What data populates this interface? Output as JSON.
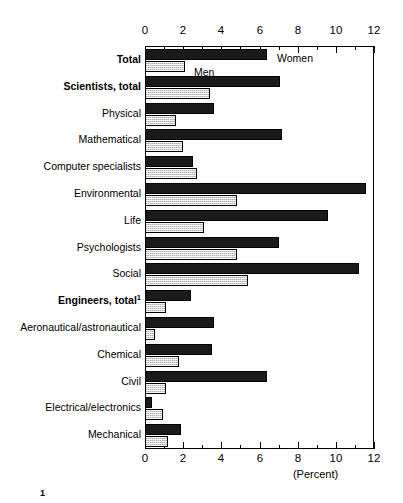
{
  "chart_data": {
    "type": "bar",
    "orientation": "horizontal",
    "title": "",
    "xlabel": "(Percent)",
    "ylabel": "",
    "xlim": [
      0,
      12
    ],
    "xticks": [
      0,
      2,
      4,
      6,
      8,
      10,
      12
    ],
    "xtick_labels": [
      "0",
      "2",
      "4",
      "6",
      "8",
      "10",
      "12"
    ],
    "minor_tick_step": 1,
    "grid": false,
    "legend_position": "in-plot annotations near top bars",
    "axis_top_labels": true,
    "axis_bottom_labels": true,
    "categories": [
      "Total",
      "Scientists, total",
      "Physical",
      "Mathematical",
      "Computer specialists",
      "Environmental",
      "Life",
      "Psychologists",
      "Social",
      "Engineers, total",
      "Aeronautical/astronautical",
      "Chemical",
      "Civil",
      "Electrical/electronics",
      "Mechanical"
    ],
    "category_styles": [
      "bold",
      "bold",
      "normal",
      "normal",
      "normal",
      "normal",
      "normal",
      "normal",
      "normal",
      "bold",
      "normal",
      "normal",
      "normal",
      "normal",
      "normal"
    ],
    "category_footnotes": [
      "",
      "",
      "",
      "",
      "",
      "",
      "",
      "",
      "",
      "1",
      "",
      "",
      "",
      "",
      ""
    ],
    "series": [
      {
        "name": "Women",
        "color": "#1a1a1a",
        "values": [
          6.4,
          7.1,
          3.6,
          7.2,
          2.5,
          11.6,
          9.6,
          7.0,
          11.2,
          2.4,
          3.6,
          3.5,
          6.4,
          0.35,
          1.9
        ]
      },
      {
        "name": "Men",
        "color": "#d2d2d2",
        "values": [
          2.1,
          3.4,
          1.6,
          2.0,
          2.7,
          4.8,
          3.1,
          4.8,
          5.4,
          1.1,
          0.5,
          1.8,
          1.1,
          0.95,
          1.2
        ]
      }
    ],
    "annotations": [
      {
        "text": "Women",
        "series": "Women",
        "category": "Total"
      },
      {
        "text": "Men",
        "series": "Men",
        "category": "Total"
      }
    ],
    "footnote_marker": "1"
  }
}
